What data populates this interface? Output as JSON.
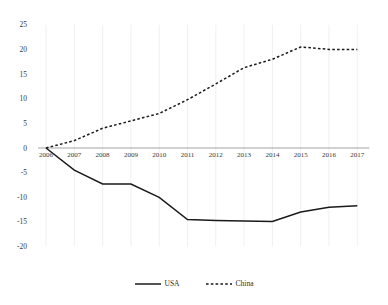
{
  "chart_data": {
    "type": "line",
    "title": "",
    "subtitle": "",
    "xlabel": "",
    "ylabel": "",
    "categories": [
      "2006",
      "2007",
      "2008",
      "2009",
      "2010",
      "2011",
      "2012",
      "2013",
      "2014",
      "2015",
      "2016",
      "2017"
    ],
    "x": [
      2006,
      2007,
      2008,
      2009,
      2010,
      2011,
      2012,
      2013,
      2014,
      2015,
      2016,
      2017
    ],
    "series": [
      {
        "name": "USA",
        "style": "solid",
        "color": "#000000",
        "values": [
          0,
          -4.5,
          -7.3,
          -7.3,
          -10.0,
          -14.5,
          -14.7,
          -14.8,
          -14.9,
          -13.0,
          -12.0,
          -11.7
        ]
      },
      {
        "name": "China",
        "style": "dashed",
        "color": "#000000",
        "values": [
          0,
          1.5,
          4.0,
          5.5,
          7.0,
          9.8,
          13.0,
          16.3,
          18.0,
          20.5,
          20.0,
          20.0
        ]
      }
    ],
    "ylim": [
      -20,
      25
    ],
    "yticks": [
      25,
      20,
      15,
      10,
      5,
      0,
      -5,
      -10,
      -15,
      -20
    ],
    "ytick_labels": [
      "25",
      "20",
      "15",
      "10",
      "5",
      "0",
      "-5",
      "-10",
      "-15",
      "-20"
    ],
    "grid": "vertical-light",
    "legend_position": "bottom",
    "axis_line_at_zero": true
  },
  "legend": {
    "items": [
      {
        "label": "USA",
        "style": "solid"
      },
      {
        "label": "China",
        "style": "dashed"
      }
    ]
  }
}
